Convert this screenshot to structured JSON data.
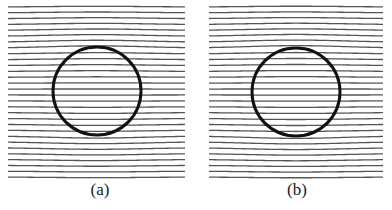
{
  "figure": {
    "panels": [
      {
        "label": "(a)",
        "x0": 8,
        "x1": 185,
        "circle": {
          "cx": 97,
          "cy": 91,
          "r": 44
        },
        "deflection": 3.2,
        "line_count": 30,
        "y_start": 7,
        "y_end": 177
      },
      {
        "label": "(b)",
        "x0": 209,
        "x1": 383,
        "circle": {
          "cx": 296,
          "cy": 92,
          "r": 44
        },
        "deflection": 3.6,
        "line_count": 30,
        "y_start": 7,
        "y_end": 177
      }
    ],
    "colors": {
      "field_line": "#555555",
      "circle_stroke": "#111111",
      "background": "#ffffff"
    }
  }
}
